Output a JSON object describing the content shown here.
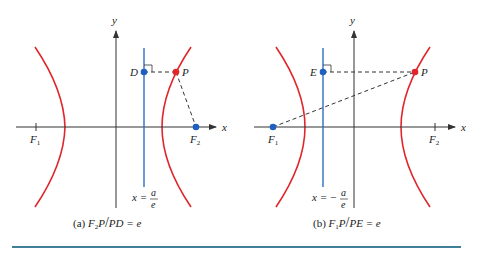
{
  "colors": {
    "hyperbola": "#e0262b",
    "directrix": "#2f6fc4",
    "axis": "#333333",
    "point_red": "#e0262b",
    "point_blue": "#1f5fbf",
    "bottom_rule": "#3f7f9a"
  },
  "panel_a": {
    "axis_x_label": "x",
    "axis_y_label": "y",
    "point_D": "D",
    "point_P": "P",
    "focus_1": "F",
    "focus_1_sub": "1",
    "focus_2": "F",
    "focus_2_sub": "2",
    "directrix_lhs": "x =",
    "directrix_num": "a",
    "directrix_den": "e",
    "caption_prefix": "(a) ",
    "caption_F": "F",
    "caption_sub": "2",
    "caption_rest": "P",
    "caption_slash": "/",
    "caption_tail": "PD = e"
  },
  "panel_b": {
    "axis_x_label": "x",
    "axis_y_label": "y",
    "point_E": "E",
    "point_P": "P",
    "focus_1": "F",
    "focus_1_sub": "1",
    "focus_2": "F",
    "focus_2_sub": "2",
    "directrix_lhs": "x = −",
    "directrix_num": "a",
    "directrix_den": "e",
    "caption_prefix": "(b) ",
    "caption_F": "F",
    "caption_sub": "1",
    "caption_rest": "P",
    "caption_slash": "/",
    "caption_tail": "PE = e"
  }
}
